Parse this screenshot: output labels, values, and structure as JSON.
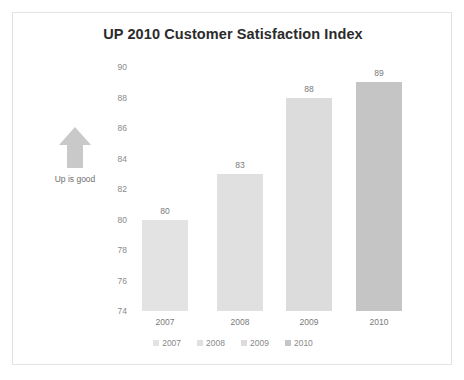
{
  "card": {
    "border_color": "#e2e2e2",
    "background": "#ffffff"
  },
  "annotation": {
    "arrow_icon": "arrow-up-icon",
    "caption": "Up is good",
    "arrow_color": "#c9c9c9"
  },
  "chart_data": {
    "type": "bar",
    "title": "UP 2010 Customer Satisfaction Index",
    "xlabel": "",
    "ylabel": "",
    "categories": [
      "2007",
      "2008",
      "2009",
      "2010"
    ],
    "values": [
      80,
      83,
      88,
      89
    ],
    "data_labels": [
      "80",
      "83",
      "88",
      "89"
    ],
    "ylim": [
      74,
      90
    ],
    "yticks": [
      90,
      88,
      86,
      84,
      82,
      80,
      78,
      76,
      74
    ],
    "ytick_labels": [
      "90",
      "88",
      "86",
      "84",
      "82",
      "80",
      "78",
      "76",
      "74"
    ],
    "grid": false,
    "legend_position": "bottom",
    "legend": [
      {
        "label": "2007",
        "color": "#e3e3e3"
      },
      {
        "label": "2008",
        "color": "#e0e0e0"
      },
      {
        "label": "2009",
        "color": "#dcdcdc"
      },
      {
        "label": "2010",
        "color": "#c5c5c5"
      }
    ],
    "series": [
      {
        "name": "2007",
        "value": 80,
        "color": "#e3e3e3"
      },
      {
        "name": "2008",
        "value": 83,
        "color": "#e0e0e0"
      },
      {
        "name": "2009",
        "value": 88,
        "color": "#dcdcdc"
      },
      {
        "name": "2010",
        "value": 89,
        "color": "#c5c5c5"
      }
    ]
  }
}
